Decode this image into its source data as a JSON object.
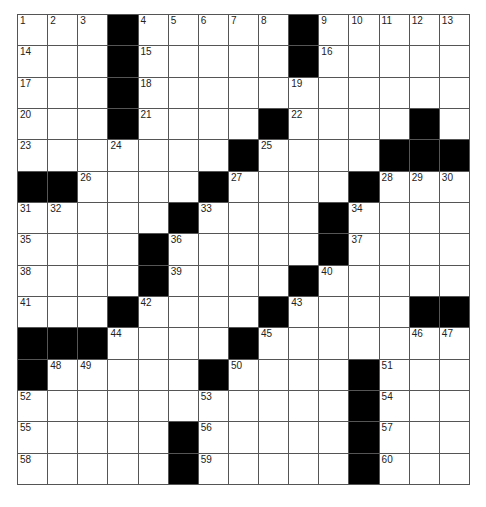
{
  "puzzle": {
    "rows": 15,
    "cols": 15,
    "colors": {
      "block": "#000000",
      "cell": "#ffffff",
      "line": "#555555"
    },
    "layout": [
      "...#.....#.....",
      "...#.....#.....",
      "...#...........",
      "...#....#....#.",
      ".......#....###",
      "##....#....#...",
      ".....#....#....",
      "....#.....#....",
      "....#....#.....",
      "...#....#....##",
      "###....#.......",
      "#.....#....#...",
      "...........#...",
      ".....#.....#...",
      ".....#.....#..."
    ],
    "numbers": [
      {
        "r": 0,
        "c": 0,
        "n": "1"
      },
      {
        "r": 0,
        "c": 1,
        "n": "2"
      },
      {
        "r": 0,
        "c": 2,
        "n": "3"
      },
      {
        "r": 0,
        "c": 4,
        "n": "4"
      },
      {
        "r": 0,
        "c": 5,
        "n": "5"
      },
      {
        "r": 0,
        "c": 6,
        "n": "6"
      },
      {
        "r": 0,
        "c": 7,
        "n": "7"
      },
      {
        "r": 0,
        "c": 8,
        "n": "8"
      },
      {
        "r": 0,
        "c": 10,
        "n": "9"
      },
      {
        "r": 0,
        "c": 11,
        "n": "10"
      },
      {
        "r": 0,
        "c": 12,
        "n": "11"
      },
      {
        "r": 0,
        "c": 13,
        "n": "12"
      },
      {
        "r": 0,
        "c": 14,
        "n": "13"
      },
      {
        "r": 1,
        "c": 0,
        "n": "14"
      },
      {
        "r": 1,
        "c": 4,
        "n": "15"
      },
      {
        "r": 1,
        "c": 10,
        "n": "16"
      },
      {
        "r": 2,
        "c": 0,
        "n": "17"
      },
      {
        "r": 2,
        "c": 4,
        "n": "18"
      },
      {
        "r": 2,
        "c": 9,
        "n": "19"
      },
      {
        "r": 3,
        "c": 0,
        "n": "20"
      },
      {
        "r": 3,
        "c": 4,
        "n": "21"
      },
      {
        "r": 3,
        "c": 9,
        "n": "22"
      },
      {
        "r": 4,
        "c": 0,
        "n": "23"
      },
      {
        "r": 4,
        "c": 3,
        "n": "24"
      },
      {
        "r": 4,
        "c": 8,
        "n": "25"
      },
      {
        "r": 5,
        "c": 2,
        "n": "26"
      },
      {
        "r": 5,
        "c": 7,
        "n": "27"
      },
      {
        "r": 5,
        "c": 12,
        "n": "28"
      },
      {
        "r": 5,
        "c": 13,
        "n": "29"
      },
      {
        "r": 5,
        "c": 14,
        "n": "30"
      },
      {
        "r": 6,
        "c": 0,
        "n": "31"
      },
      {
        "r": 6,
        "c": 1,
        "n": "32"
      },
      {
        "r": 6,
        "c": 6,
        "n": "33"
      },
      {
        "r": 6,
        "c": 11,
        "n": "34"
      },
      {
        "r": 7,
        "c": 0,
        "n": "35"
      },
      {
        "r": 7,
        "c": 5,
        "n": "36"
      },
      {
        "r": 7,
        "c": 11,
        "n": "37"
      },
      {
        "r": 8,
        "c": 0,
        "n": "38"
      },
      {
        "r": 8,
        "c": 5,
        "n": "39"
      },
      {
        "r": 8,
        "c": 10,
        "n": "40"
      },
      {
        "r": 9,
        "c": 0,
        "n": "41"
      },
      {
        "r": 9,
        "c": 4,
        "n": "42"
      },
      {
        "r": 9,
        "c": 9,
        "n": "43"
      },
      {
        "r": 10,
        "c": 3,
        "n": "44"
      },
      {
        "r": 10,
        "c": 8,
        "n": "45"
      },
      {
        "r": 10,
        "c": 13,
        "n": "46"
      },
      {
        "r": 10,
        "c": 14,
        "n": "47"
      },
      {
        "r": 11,
        "c": 1,
        "n": "48"
      },
      {
        "r": 11,
        "c": 2,
        "n": "49"
      },
      {
        "r": 11,
        "c": 7,
        "n": "50"
      },
      {
        "r": 11,
        "c": 12,
        "n": "51"
      },
      {
        "r": 12,
        "c": 0,
        "n": "52"
      },
      {
        "r": 12,
        "c": 6,
        "n": "53"
      },
      {
        "r": 12,
        "c": 12,
        "n": "54"
      },
      {
        "r": 13,
        "c": 0,
        "n": "55"
      },
      {
        "r": 13,
        "c": 6,
        "n": "56"
      },
      {
        "r": 13,
        "c": 12,
        "n": "57"
      },
      {
        "r": 14,
        "c": 0,
        "n": "58"
      },
      {
        "r": 14,
        "c": 6,
        "n": "59"
      },
      {
        "r": 14,
        "c": 12,
        "n": "60"
      }
    ]
  }
}
